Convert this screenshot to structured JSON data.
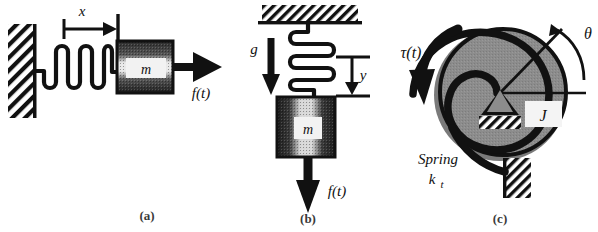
{
  "figure": {
    "background_color": "#ffffff",
    "ink_color": "#111111",
    "disk_color": "#8c8c8c",
    "disk_shadow_color": "#7a7a7a"
  },
  "panels": [
    {
      "id": "a",
      "caption": "(a)",
      "name": "horizontal-spring-mass",
      "labels": {
        "displacement": "x",
        "mass": "m",
        "force": "f(t)"
      },
      "elements": {
        "wall": "hatched-wall",
        "spring": "coil-spring",
        "mass_block": "mass-block",
        "force_arrow": "force-arrow-right",
        "dimension": "displacement-dimension"
      }
    },
    {
      "id": "b",
      "caption": "(b)",
      "name": "vertical-spring-mass",
      "labels": {
        "gravity": "g",
        "displacement": "y",
        "mass": "m",
        "force": "f(t)"
      },
      "elements": {
        "ceiling": "hatched-ceiling",
        "spring": "coil-spring-vertical",
        "mass_block": "mass-block",
        "force_arrow": "force-arrow-down",
        "gravity_arrow": "gravity-arrow-down",
        "dimension": "displacement-dimension"
      }
    },
    {
      "id": "c",
      "caption": "(c)",
      "name": "rotational-inertia-torsional-spring",
      "labels": {
        "torque": "τ(t)",
        "angle": "θ",
        "inertia": "J",
        "spring_name": "Spring",
        "spring_constant": "k",
        "spring_constant_sub": "t"
      },
      "elements": {
        "disk": "inertia-disk",
        "torsional_spring": "torsional-spiral-spring",
        "pivot": "pivot-triangle",
        "ground": "hatched-ground",
        "torque_arrow": "torque-curved-arrow",
        "angle_arrow": "angle-curved-arrow",
        "radial_line": "angle-radial-line",
        "reference_line": "horizontal-reference-line",
        "anchor": "hatched-anchor-block"
      }
    }
  ]
}
